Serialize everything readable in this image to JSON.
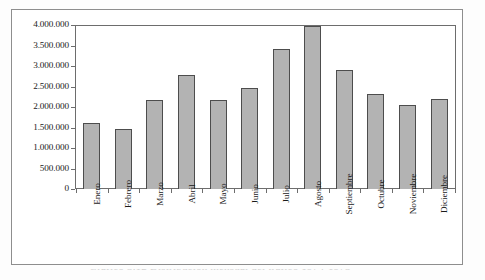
{
  "figure": {
    "frame_visible": true,
    "caption_partial": "Gráfico 3.12  Distribución mensual del tráfico 1974-1975"
  },
  "chart_data": {
    "type": "bar",
    "title": "",
    "subtitle": "",
    "xlabel": "",
    "ylabel": "",
    "categories": [
      "Enero",
      "Febrero",
      "Marzo",
      "Abril",
      "Mayo",
      "Junio",
      "Julio",
      "Agosto",
      "Septiembre",
      "Octubre",
      "Noviembre",
      "Diciembre"
    ],
    "values": [
      1630000,
      1480000,
      2180000,
      2790000,
      2180000,
      2470000,
      3440000,
      4000000,
      2910000,
      2330000,
      2050000,
      2220000
    ],
    "ylim": [
      0,
      4000000
    ],
    "ytick_values": [
      4000000,
      3500000,
      3000000,
      2500000,
      2000000,
      1500000,
      1000000,
      500000,
      0
    ],
    "ytick_labels": [
      "4.000.000",
      "3.500.000",
      "3.000.000",
      "2.500.000",
      "2.000.000",
      "1.500.000",
      "1.000.000",
      "500.000",
      "0"
    ],
    "grid": false,
    "legend": null,
    "legend_position": "none",
    "bar_fill_color": "#b3b3b3",
    "bar_border_color": "#4d4d4d",
    "axis_color": "#6d6d6d",
    "plot_background": "#ffffff",
    "annotations": []
  }
}
